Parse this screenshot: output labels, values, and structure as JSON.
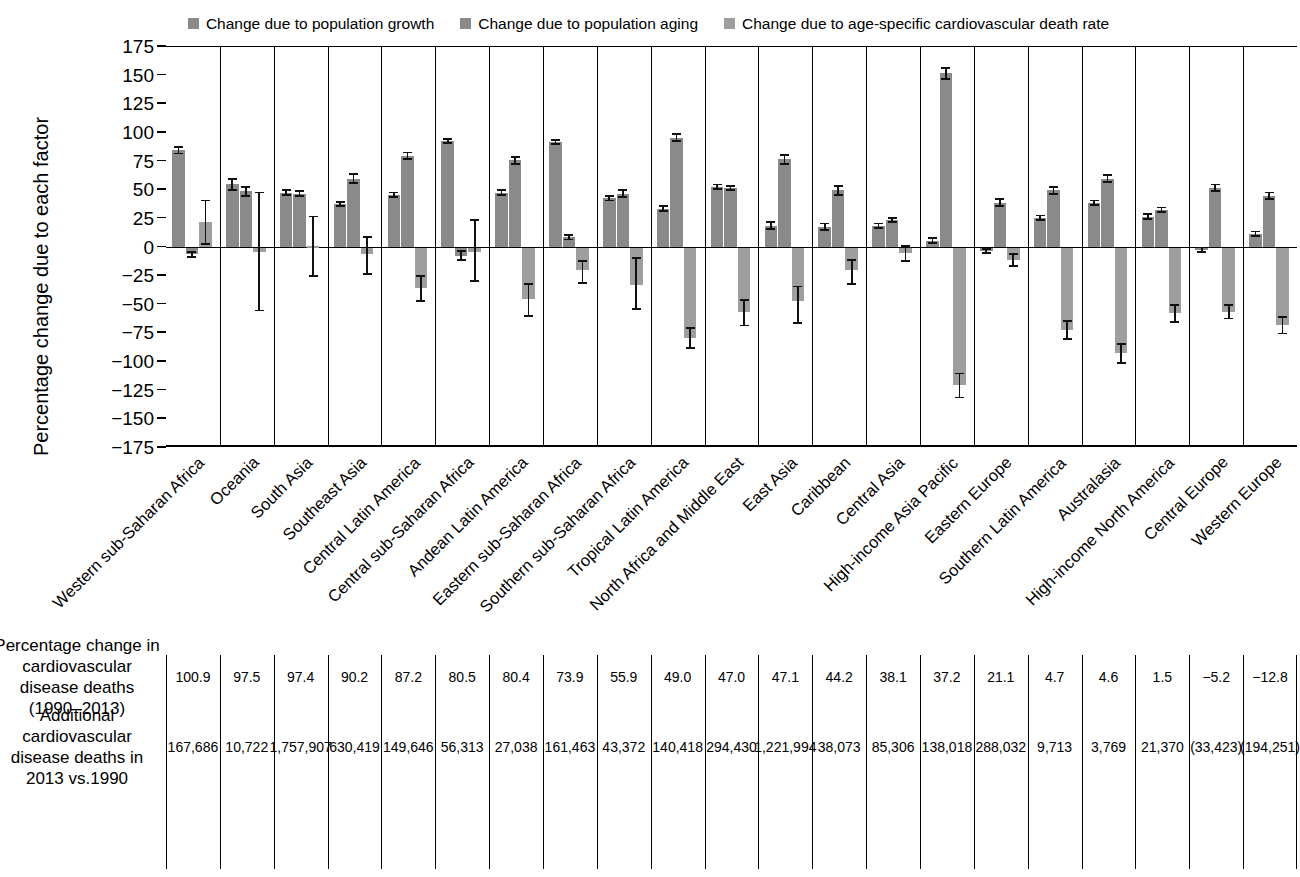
{
  "legend": {
    "items": [
      {
        "label": "Change due to population growth",
        "color": "#8a8a8a",
        "icon": "square-swatch"
      },
      {
        "label": "Change due to population aging",
        "color": "#8a8a8a",
        "icon": "square-swatch"
      },
      {
        "label": "Change due to age-specific cardiovascular death rate",
        "color": "#9e9e9e",
        "icon": "square-swatch"
      }
    ]
  },
  "axes": {
    "ylabel": "Percentage change due to each factor",
    "yticks": [
      175,
      150,
      125,
      100,
      75,
      50,
      25,
      0,
      -25,
      -50,
      -75,
      -100,
      -125,
      -150,
      -175
    ],
    "ytick_labels": [
      "175",
      "150",
      "125",
      "100",
      "75",
      "50",
      "25",
      "0",
      "−25",
      "−50",
      "−75",
      "−100",
      "−125",
      "−150",
      "−175"
    ],
    "ylim": [
      -175,
      175
    ]
  },
  "table": {
    "row_labels": [
      "Percentage change in cardiovascular disease deaths (1990–2013)",
      "Additional cardiovascular disease deaths in 2013 vs.1990"
    ],
    "row1": [
      "100.9",
      "97.5",
      "97.4",
      "90.2",
      "87.2",
      "80.5",
      "80.4",
      "73.9",
      "55.9",
      "49.0",
      "47.0",
      "47.1",
      "44.2",
      "38.1",
      "37.2",
      "21.1",
      "4.7",
      "4.6",
      "1.5",
      "−5.2",
      "−12.8"
    ],
    "row2": [
      "167,686",
      "10,722",
      "1,757,907",
      "630,419",
      "149,646",
      "56,313",
      "27,038",
      "161,463",
      "43,372",
      "140,418",
      "294,430",
      "1,221,994",
      "38,073",
      "85,306",
      "138,018",
      "288,032",
      "9,713",
      "3,769",
      "21,370",
      "(33,423)",
      "(194,251)"
    ]
  },
  "chart_data": {
    "type": "bar",
    "title": "",
    "xlabel": "",
    "ylabel": "Percentage change due to each factor",
    "ylim": [
      -175,
      175
    ],
    "grid": false,
    "legend_position": "top-center",
    "categories": [
      "Western sub-Saharan Africa",
      "Oceania",
      "South Asia",
      "Southeast Asia",
      "Central Latin America",
      "Central sub-Saharan Africa",
      "Andean Latin America",
      "Eastern sub-Saharan Africa",
      "Southern sub-Saharan Africa",
      "Tropical Latin America",
      "North Africa and Middle East",
      "East Asia",
      "Caribbean",
      "Central Asia",
      "High-income Asia Pacific",
      "Eastern Europe",
      "Southern Latin America",
      "Australasia",
      "High-income North America",
      "Central Europe",
      "Western Europe"
    ],
    "series": [
      {
        "name": "Change due to population growth",
        "color": "#8a8a8a",
        "values": [
          85,
          55,
          48,
          38,
          46,
          93,
          48,
          92,
          43,
          34,
          53,
          19,
          18,
          19,
          6,
          -3,
          26,
          39,
          27,
          -2,
          12
        ],
        "err_low": [
          82,
          50,
          46,
          36,
          44,
          91,
          46,
          90,
          41,
          32,
          51,
          16,
          15,
          17,
          4,
          -5,
          24,
          37,
          25,
          -4,
          10
        ],
        "err_high": [
          88,
          60,
          50,
          40,
          48,
          95,
          50,
          94,
          45,
          36,
          55,
          22,
          21,
          21,
          8,
          -1,
          28,
          41,
          29,
          0,
          14
        ]
      },
      {
        "name": "Change due to population aging",
        "color": "#8a8a8a",
        "values": [
          -6,
          49,
          47,
          60,
          80,
          -7,
          76,
          9,
          47,
          96,
          52,
          77,
          50,
          24,
          152,
          39,
          50,
          60,
          33,
          52,
          45
        ],
        "err_low": [
          -8,
          45,
          45,
          56,
          77,
          -11,
          73,
          7,
          44,
          93,
          50,
          73,
          46,
          22,
          147,
          36,
          47,
          57,
          31,
          49,
          42
        ],
        "err_high": [
          -4,
          53,
          49,
          64,
          83,
          -3,
          79,
          11,
          50,
          99,
          54,
          81,
          54,
          26,
          157,
          42,
          53,
          63,
          35,
          55,
          48
        ]
      },
      {
        "name": "Change due to age-specific cardiovascular death rate",
        "color": "#9e9e9e",
        "values": [
          22,
          -4,
          1,
          -6,
          -35,
          -4,
          -45,
          -20,
          -33,
          -79,
          -56,
          -47,
          -20,
          -5,
          -120,
          -11,
          -72,
          -92,
          -57,
          -56,
          -68
        ],
        "err_low": [
          3,
          -55,
          -25,
          -23,
          -47,
          -29,
          -60,
          -31,
          -54,
          -88,
          -68,
          -66,
          -32,
          -12,
          -131,
          -16,
          -80,
          -101,
          -65,
          -62,
          -75
        ],
        "err_high": [
          41,
          48,
          27,
          9,
          -25,
          24,
          -32,
          -12,
          -9,
          -70,
          -46,
          -34,
          -11,
          1,
          -110,
          -6,
          -64,
          -84,
          -50,
          -50,
          -61
        ]
      }
    ]
  }
}
